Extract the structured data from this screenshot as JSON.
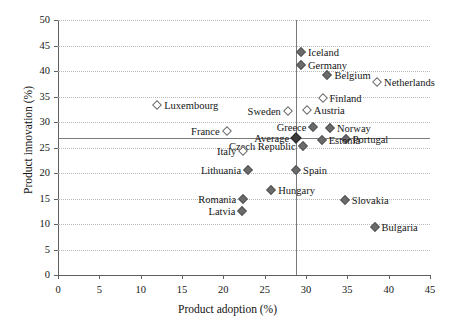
{
  "chart_data": {
    "type": "scatter",
    "title": "",
    "xlabel": "Product adoption (%)",
    "ylabel": "Product innovation (%)",
    "xlim": [
      0,
      45
    ],
    "ylim": [
      0,
      50
    ],
    "xticks": [
      "0",
      "5",
      "10",
      "15",
      "20",
      "25",
      "30",
      "35",
      "40",
      "45"
    ],
    "yticks": [
      "0",
      "5",
      "10",
      "15",
      "20",
      "25",
      "30",
      "35",
      "40",
      "45",
      "50"
    ],
    "grid": "horizontal-dotted",
    "legend": "none",
    "reference_lines": {
      "vertical_average_x": 28.8,
      "horizontal_average_y": 26.9,
      "note": "EU average crosshair lines"
    },
    "marker_styles": {
      "filled": "filled diamond (above-average adoption or flagged group)",
      "open": "open diamond",
      "average": "bold filled diamond"
    },
    "points": [
      {
        "name": "Iceland",
        "x": 29.4,
        "y": 43.7,
        "style": "filled",
        "label_side": "right"
      },
      {
        "name": "Germany",
        "x": 29.4,
        "y": 41.2,
        "style": "filled",
        "label_side": "right"
      },
      {
        "name": "Belgium",
        "x": 32.6,
        "y": 39.2,
        "style": "filled",
        "label_side": "right"
      },
      {
        "name": "Netherlands",
        "x": 38.6,
        "y": 37.8,
        "style": "open",
        "label_side": "right"
      },
      {
        "name": "Finland",
        "x": 32.0,
        "y": 34.7,
        "style": "open",
        "label_side": "right"
      },
      {
        "name": "Luxembourg",
        "x": 12.0,
        "y": 33.3,
        "style": "open",
        "label_side": "right"
      },
      {
        "name": "Austria",
        "x": 30.1,
        "y": 32.4,
        "style": "open",
        "label_side": "right"
      },
      {
        "name": "Sweden",
        "x": 27.8,
        "y": 32.2,
        "style": "open",
        "label_side": "left"
      },
      {
        "name": "Greece",
        "x": 30.9,
        "y": 29.0,
        "style": "filled",
        "label_side": "left"
      },
      {
        "name": "Norway",
        "x": 32.9,
        "y": 28.8,
        "style": "filled",
        "label_side": "right"
      },
      {
        "name": "France",
        "x": 20.4,
        "y": 28.2,
        "style": "open",
        "label_side": "left"
      },
      {
        "name": "Average",
        "x": 28.8,
        "y": 26.9,
        "style": "average",
        "label_side": "left"
      },
      {
        "name": "Portugal",
        "x": 34.8,
        "y": 26.7,
        "style": "filled",
        "label_side": "right"
      },
      {
        "name": "Estonia",
        "x": 31.9,
        "y": 26.5,
        "style": "filled",
        "label_side": "right"
      },
      {
        "name": "Czech Republic",
        "x": 29.6,
        "y": 25.3,
        "style": "filled",
        "label_side": "left"
      },
      {
        "name": "Italy",
        "x": 22.4,
        "y": 24.3,
        "style": "open",
        "label_side": "left"
      },
      {
        "name": "Lithuania",
        "x": 23.0,
        "y": 20.6,
        "style": "filled",
        "label_side": "left"
      },
      {
        "name": "Spain",
        "x": 28.8,
        "y": 20.6,
        "style": "filled",
        "label_side": "right"
      },
      {
        "name": "Hungary",
        "x": 25.8,
        "y": 16.7,
        "style": "filled",
        "label_side": "right"
      },
      {
        "name": "Romania",
        "x": 22.4,
        "y": 14.9,
        "style": "filled",
        "label_side": "left"
      },
      {
        "name": "Slovakia",
        "x": 34.7,
        "y": 14.7,
        "style": "filled",
        "label_side": "right"
      },
      {
        "name": "Latvia",
        "x": 22.3,
        "y": 12.5,
        "style": "filled",
        "label_side": "left"
      },
      {
        "name": "Bulgaria",
        "x": 38.3,
        "y": 9.4,
        "style": "filled",
        "label_side": "right"
      }
    ]
  },
  "colors": {
    "marker_fill": "#6b6b6b",
    "marker_edge": "#555555",
    "average_marker": "#3a3a3a",
    "axis": "#5f5f5f",
    "gridline": "#b9b9b9",
    "reference_line": "#7a7a7a",
    "text": "#161616",
    "background": "#ffffff"
  }
}
